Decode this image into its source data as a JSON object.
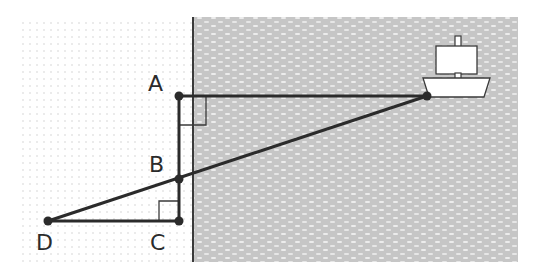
{
  "diagram": {
    "type": "geometry-word-problem",
    "colors": {
      "water": "#c9c9c9",
      "water_highlight": "#ececec",
      "land_dots": "#d6d6d6",
      "line": "#2b2b2b",
      "ship_fill": "#ffffff"
    },
    "labels": {
      "A": "A",
      "B": "B",
      "C": "C",
      "D": "D"
    },
    "points": {
      "A": [
        179,
        96
      ],
      "B": [
        179,
        179
      ],
      "C": [
        179,
        221
      ],
      "D": [
        48,
        221
      ],
      "Ship": [
        427,
        96
      ]
    },
    "segments": [
      "A-Ship",
      "A-C",
      "D-C",
      "D-Ship"
    ],
    "right_angles": [
      "A",
      "C"
    ],
    "regions": {
      "land": "dotted",
      "water": "textured gray",
      "shoreline_x": 193
    }
  }
}
